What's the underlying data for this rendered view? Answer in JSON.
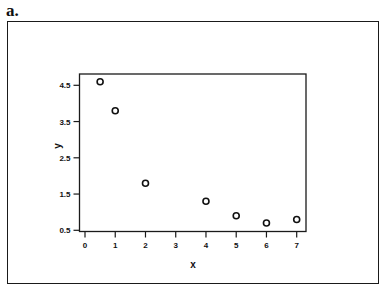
{
  "panel_label": "a.",
  "chart_data": {
    "type": "scatter",
    "title": "",
    "xlabel": "x",
    "ylabel": "y",
    "xlim": [
      0,
      7
    ],
    "ylim": [
      0.5,
      4.5
    ],
    "xticks": [
      0,
      1,
      2,
      3,
      4,
      5,
      6,
      7
    ],
    "yticks": [
      0.5,
      1.5,
      2.5,
      3.5,
      4.5
    ],
    "ytick_labels": [
      "0.5",
      "1.5",
      "2.5",
      "3.5",
      "4.5"
    ],
    "grid": false,
    "legend": null,
    "marker": "open-circle",
    "series": [
      {
        "name": "data",
        "x": [
          0.5,
          1,
          2,
          4,
          5,
          6,
          7
        ],
        "y": [
          4.6,
          3.8,
          1.8,
          1.3,
          0.9,
          0.7,
          0.8
        ]
      }
    ]
  }
}
